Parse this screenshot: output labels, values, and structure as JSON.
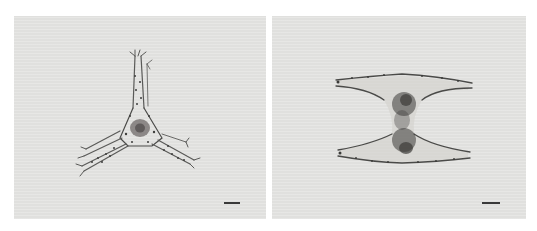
{
  "figure": {
    "panels": [
      {
        "id": "left",
        "subject": "tri-radiate plankton specimen with three spined arms",
        "background_color": "#e4e4e2",
        "scale_bar": {
          "visible": true,
          "label": ""
        }
      },
      {
        "id": "right",
        "subject": "hourglass-shaped plankton specimen with two horizontal spined arms",
        "background_color": "#e4e4e2",
        "scale_bar": {
          "visible": true,
          "label": ""
        }
      }
    ],
    "colors": {
      "page_background": "#ffffff",
      "panel_background": "#e4e4e2",
      "specimen_outline": "#4a4a48",
      "specimen_dark": "#3a3a3a",
      "scale_bar": "#3a3a3a"
    }
  }
}
